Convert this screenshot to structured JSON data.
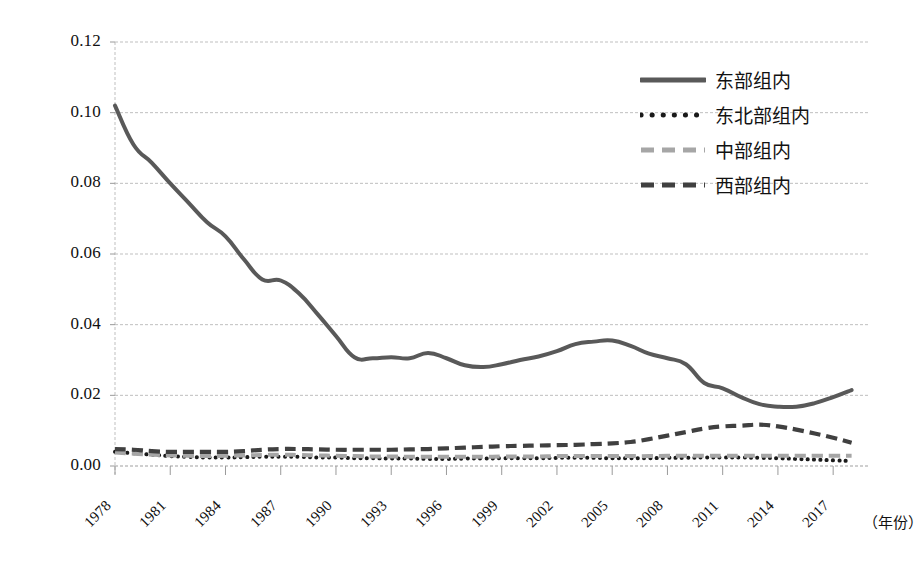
{
  "chart_data": {
    "type": "line",
    "title": "",
    "xlabel": "（年份）",
    "ylabel": "",
    "xlim": [
      1978,
      2019
    ],
    "ylim": [
      0.0,
      0.12
    ],
    "ytick_step": 0.02,
    "grid": true,
    "legend_position": "top-right",
    "y_ticks": [
      "0.00",
      "0.02",
      "0.04",
      "0.06",
      "0.08",
      "0.10",
      "0.12"
    ],
    "y_tick_values": [
      0.0,
      0.02,
      0.04,
      0.06,
      0.08,
      0.1,
      0.12
    ],
    "x_ticks": [
      "1978",
      "1981",
      "1984",
      "1987",
      "1990",
      "1993",
      "1996",
      "1999",
      "2002",
      "2005",
      "2008",
      "2011",
      "2014",
      "2017"
    ],
    "x_tick_values": [
      1978,
      1981,
      1984,
      1987,
      1990,
      1993,
      1996,
      1999,
      2002,
      2005,
      2008,
      2011,
      2014,
      2017
    ],
    "x": [
      1978,
      1979,
      1980,
      1981,
      1982,
      1983,
      1984,
      1985,
      1986,
      1987,
      1988,
      1989,
      1990,
      1991,
      1992,
      1993,
      1994,
      1995,
      1996,
      1997,
      1998,
      1999,
      2000,
      2001,
      2002,
      2003,
      2004,
      2005,
      2006,
      2007,
      2008,
      2009,
      2010,
      2011,
      2012,
      2013,
      2014,
      2015,
      2016,
      2017,
      2018
    ],
    "series": [
      {
        "name": "东部组内",
        "style": "solid",
        "color": "#595959",
        "values": [
          0.102,
          0.091,
          0.0858,
          0.08,
          0.0745,
          0.069,
          0.065,
          0.0585,
          0.0528,
          0.0525,
          0.0488,
          0.043,
          0.0368,
          0.0308,
          0.0305,
          0.0308,
          0.0305,
          0.032,
          0.0305,
          0.0285,
          0.028,
          0.0288,
          0.03,
          0.031,
          0.0325,
          0.0345,
          0.0352,
          0.0355,
          0.034,
          0.0318,
          0.0305,
          0.0288,
          0.0235,
          0.022,
          0.0195,
          0.0175,
          0.0168,
          0.0168,
          0.0178,
          0.0195,
          0.0215
        ]
      },
      {
        "name": "东北部组内",
        "style": "dotted",
        "color": "#1a1a1a",
        "values": [
          0.004,
          0.0036,
          0.0032,
          0.0028,
          0.0026,
          0.0024,
          0.0024,
          0.0025,
          0.0026,
          0.0026,
          0.0026,
          0.0024,
          0.0024,
          0.0022,
          0.0022,
          0.0021,
          0.0021,
          0.002,
          0.002,
          0.0021,
          0.0021,
          0.0022,
          0.0022,
          0.0022,
          0.0023,
          0.0023,
          0.0023,
          0.0022,
          0.0022,
          0.0022,
          0.0023,
          0.0023,
          0.0024,
          0.0024,
          0.0024,
          0.0023,
          0.0022,
          0.002,
          0.0018,
          0.0016,
          0.0014
        ]
      },
      {
        "name": "中部组内",
        "style": "dashed-light",
        "color": "#a6a6a6",
        "values": [
          0.0038,
          0.0035,
          0.0032,
          0.003,
          0.0029,
          0.0028,
          0.0029,
          0.003,
          0.0031,
          0.0032,
          0.0031,
          0.003,
          0.0029,
          0.0028,
          0.0027,
          0.0027,
          0.0026,
          0.0026,
          0.0026,
          0.0026,
          0.0026,
          0.0027,
          0.0027,
          0.0027,
          0.0028,
          0.0028,
          0.0028,
          0.0028,
          0.0028,
          0.0028,
          0.0029,
          0.0029,
          0.0029,
          0.0029,
          0.0029,
          0.0029,
          0.0029,
          0.0029,
          0.0029,
          0.0029,
          0.0029
        ]
      },
      {
        "name": "西部组内",
        "style": "dashed-dark",
        "color": "#404040",
        "values": [
          0.0048,
          0.0046,
          0.0042,
          0.004,
          0.004,
          0.004,
          0.004,
          0.0042,
          0.0046,
          0.0048,
          0.0048,
          0.0047,
          0.0046,
          0.0046,
          0.0046,
          0.0046,
          0.0047,
          0.0048,
          0.005,
          0.0052,
          0.0054,
          0.0056,
          0.0057,
          0.0058,
          0.0059,
          0.006,
          0.0062,
          0.0064,
          0.0068,
          0.0076,
          0.0086,
          0.0096,
          0.0106,
          0.0112,
          0.0114,
          0.0117,
          0.0112,
          0.0103,
          0.0092,
          0.008,
          0.0066
        ]
      }
    ]
  },
  "legend": {
    "items": [
      {
        "label": "东部组内"
      },
      {
        "label": "东北部组内"
      },
      {
        "label": "中部组内"
      },
      {
        "label": "西部组内"
      }
    ]
  }
}
